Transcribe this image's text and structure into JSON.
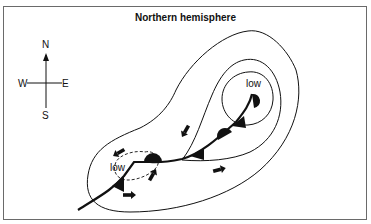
{
  "title": "Northern hemisphere",
  "compass": {
    "north": "N",
    "south": "S",
    "east": "E",
    "west": "W"
  },
  "labels": {
    "low_main": "low",
    "low_secondary": "low"
  },
  "colors": {
    "line": "#111111",
    "frame": "#6a6a6a",
    "background": "#ffffff"
  }
}
